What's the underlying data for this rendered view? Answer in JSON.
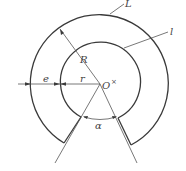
{
  "diagram": {
    "type": "annular-sector-with-gap",
    "colors": {
      "line": "#3a3a3a",
      "text": "#444444",
      "background": "#ffffff"
    },
    "labels": {
      "outer_curve": "L",
      "inner_curve": "l",
      "outer_radius": "R",
      "inner_radius": "r",
      "ring_width": "e",
      "center": "O",
      "center_mark": "×",
      "gap_angle": "α"
    }
  }
}
